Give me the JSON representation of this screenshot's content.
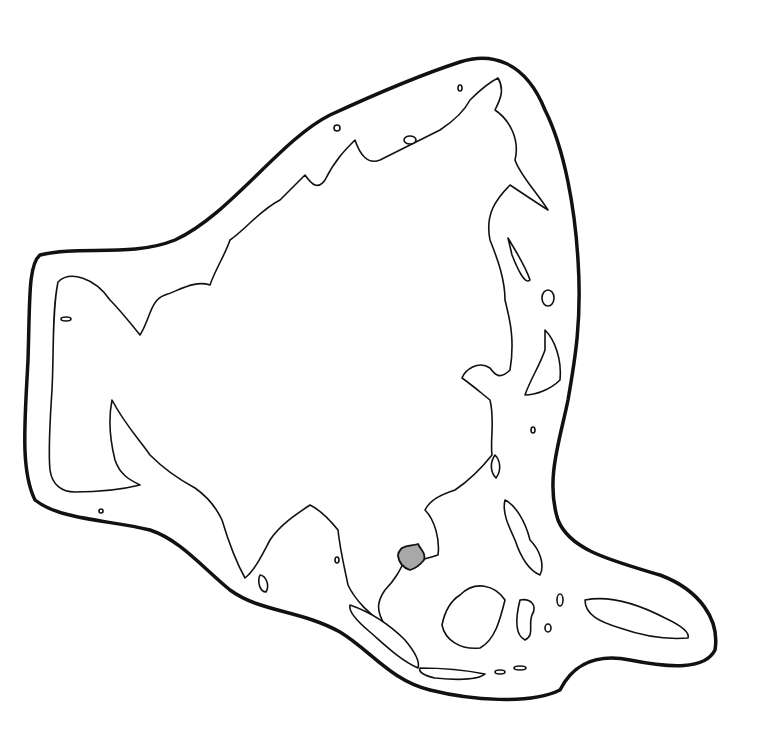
{
  "map": {
    "region": "Asia",
    "style": "outline map",
    "highlighted_country": "Cambodia",
    "highlight_color": "#a8a8a8",
    "line_color": "#111111",
    "background": "#ffffff"
  }
}
